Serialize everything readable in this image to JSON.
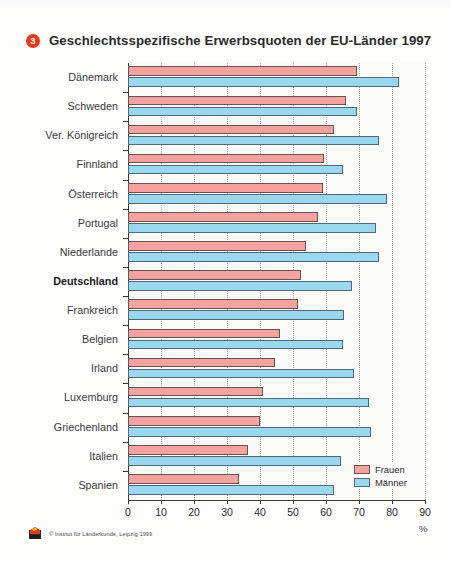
{
  "figure": {
    "number": "3",
    "title": "Geschlechtsspezifische Erwerbsquoten der EU-Länder 1997",
    "unit": "%",
    "source": "© Institut für Länderkunde, Leipzig 1999",
    "logo_icon": "ifl-logo-icon"
  },
  "legend": {
    "items": [
      {
        "label": "Frauen",
        "color": "#f4a3a0"
      },
      {
        "label": "Männer",
        "color": "#9ad8f0"
      }
    ]
  },
  "axis": {
    "x_ticks": [
      "0",
      "10",
      "20",
      "30",
      "40",
      "50",
      "60",
      "70",
      "80",
      "90"
    ]
  },
  "chart_data": {
    "type": "bar",
    "orientation": "horizontal",
    "title": "Geschlechtsspezifische Erwerbsquoten der EU-Länder 1997",
    "xlabel": "%",
    "ylabel": "",
    "xlim": [
      0,
      90
    ],
    "xticks": [
      0,
      10,
      20,
      30,
      40,
      50,
      60,
      70,
      80,
      90
    ],
    "grid": "vertical-dotted",
    "legend_position": "bottom-right",
    "highlight_category": "Deutschland",
    "categories": [
      "Dänemark",
      "Schweden",
      "Ver. Königreich",
      "Finnland",
      "Österreich",
      "Portugal",
      "Niederlande",
      "Deutschland",
      "Frankreich",
      "Belgien",
      "Irland",
      "Luxemburg",
      "Griechenland",
      "Italien",
      "Spanien"
    ],
    "series": [
      {
        "name": "Frauen",
        "color": "#f4a3a0",
        "values": [
          69.5,
          66.0,
          62.5,
          59.5,
          59.0,
          57.5,
          54.0,
          52.5,
          51.5,
          46.0,
          44.5,
          41.0,
          40.0,
          36.5,
          33.5
        ]
      },
      {
        "name": "Männer",
        "color": "#9ad8f0",
        "values": [
          82.0,
          69.5,
          76.0,
          65.0,
          78.5,
          75.0,
          76.0,
          68.0,
          65.5,
          65.0,
          68.5,
          73.0,
          73.5,
          64.5,
          62.5
        ]
      }
    ]
  }
}
